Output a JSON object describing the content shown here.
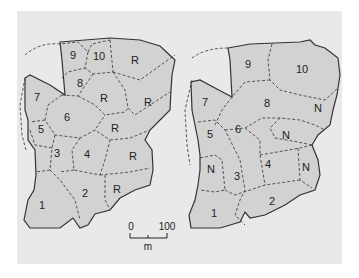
{
  "colors": {
    "background": "#e9e9e9",
    "land": "#d2d2d2",
    "outline": "#333333"
  },
  "left_map": {
    "labels": [
      {
        "text": "9",
        "x": 73,
        "y": 56
      },
      {
        "text": "10",
        "x": 99,
        "y": 57
      },
      {
        "text": "R",
        "x": 135,
        "y": 61
      },
      {
        "text": "8",
        "x": 80,
        "y": 84
      },
      {
        "text": "7",
        "x": 37,
        "y": 98
      },
      {
        "text": "R",
        "x": 104,
        "y": 99
      },
      {
        "text": "R",
        "x": 148,
        "y": 103
      },
      {
        "text": "6",
        "x": 67,
        "y": 118
      },
      {
        "text": "5",
        "x": 41,
        "y": 130
      },
      {
        "text": "R",
        "x": 115,
        "y": 129
      },
      {
        "text": "3",
        "x": 57,
        "y": 154
      },
      {
        "text": "4",
        "x": 87,
        "y": 155
      },
      {
        "text": "R",
        "x": 133,
        "y": 157
      },
      {
        "text": "R",
        "x": 117,
        "y": 190
      },
      {
        "text": "2",
        "x": 85,
        "y": 194
      },
      {
        "text": "1",
        "x": 42,
        "y": 206
      }
    ]
  },
  "right_map": {
    "labels": [
      {
        "text": "9",
        "x": 248,
        "y": 65
      },
      {
        "text": "10",
        "x": 302,
        "y": 70
      },
      {
        "text": "8",
        "x": 267,
        "y": 104
      },
      {
        "text": "7",
        "x": 205,
        "y": 103
      },
      {
        "text": "N",
        "x": 318,
        "y": 109
      },
      {
        "text": "6",
        "x": 238,
        "y": 130
      },
      {
        "text": "5",
        "x": 210,
        "y": 135
      },
      {
        "text": "N",
        "x": 286,
        "y": 136
      },
      {
        "text": "N",
        "x": 211,
        "y": 170
      },
      {
        "text": "3",
        "x": 237,
        "y": 177
      },
      {
        "text": "4",
        "x": 268,
        "y": 165
      },
      {
        "text": "N",
        "x": 306,
        "y": 168
      },
      {
        "text": "2",
        "x": 272,
        "y": 202
      },
      {
        "text": "1",
        "x": 214,
        "y": 214
      }
    ]
  },
  "scale_bar": {
    "label_start": "0",
    "label_end": "100",
    "unit": "m"
  }
}
